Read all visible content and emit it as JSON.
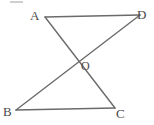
{
  "figure": {
    "name": "two-intersecting-triangles-diagram",
    "width": 154,
    "height": 125,
    "background_color": "#ffffff",
    "line_color": "#6b6b6b",
    "label_color": "#4a4a4a",
    "corner_rule_color": "#cfcfcf",
    "line_width": 1.4
  },
  "labels": {
    "A": "A",
    "B": "B",
    "C": "C",
    "D": "D",
    "O": "O"
  },
  "points": {
    "A": {
      "x": 45,
      "y": 17
    },
    "D": {
      "x": 140,
      "y": 15
    },
    "B": {
      "x": 16,
      "y": 110
    },
    "C": {
      "x": 115,
      "y": 108
    },
    "O": {
      "x": 76,
      "y": 62
    }
  },
  "segments": [
    {
      "name": "segment-AD",
      "from": "A",
      "to": "D"
    },
    {
      "name": "segment-BC",
      "from": "B",
      "to": "C"
    },
    {
      "name": "segment-AC",
      "from": "A",
      "to": "C"
    },
    {
      "name": "segment-BD",
      "from": "B",
      "to": "D"
    }
  ]
}
